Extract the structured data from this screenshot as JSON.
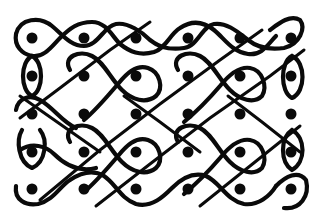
{
  "figure": {
    "colors": {
      "line": "#0a0a0a",
      "background": "#ffffff"
    },
    "grid": {
      "columns": 6,
      "rows": 5,
      "x": [
        32,
        84,
        136,
        188,
        240,
        291
      ],
      "y": [
        38,
        76,
        114,
        152,
        189
      ],
      "dot_radius": 5.5
    }
  }
}
